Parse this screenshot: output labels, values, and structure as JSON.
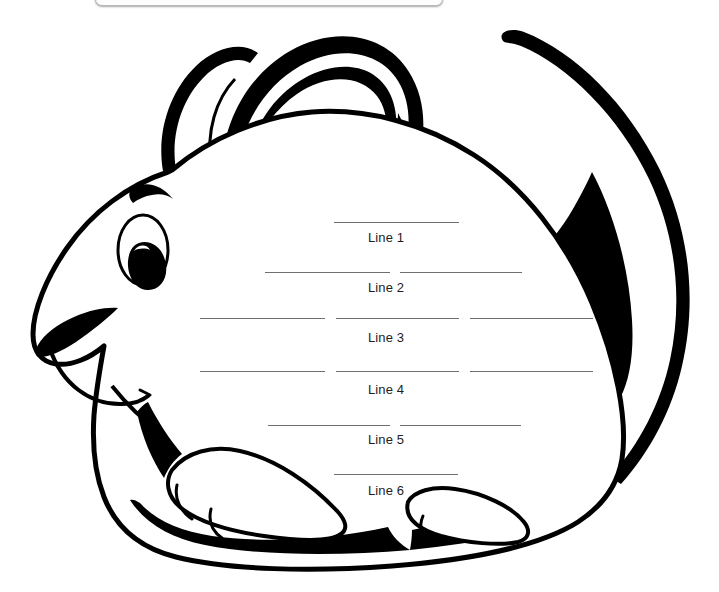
{
  "page": {
    "background_color": "#ffffff",
    "width": 719,
    "height": 592
  },
  "window_frame": {
    "visible": true,
    "border_color": "#b9b9b9"
  },
  "artwork": {
    "subject": "mouse",
    "style": "black-and-white line art coloring page",
    "stroke_color": "#000000",
    "fill_color": "#ffffff",
    "parts": [
      "tail",
      "large-ear",
      "small-ear",
      "head",
      "eyebrow",
      "eye",
      "pupil",
      "nose",
      "mouth",
      "body",
      "front-paw",
      "rear-paw",
      "ground-shadow"
    ]
  },
  "worksheet": {
    "line_color": "#6f6f6f",
    "label_color": "#1d1d1d",
    "rows": [
      {
        "label": "Line 1",
        "label_x": 368,
        "label_y": 230,
        "rules": [
          {
            "x": 334,
            "y": 222,
            "w": 125
          }
        ]
      },
      {
        "label": "Line 2",
        "label_x": 368,
        "label_y": 280,
        "rules": [
          {
            "x": 265,
            "y": 272,
            "w": 125
          },
          {
            "x": 400,
            "y": 272,
            "w": 122
          }
        ]
      },
      {
        "label": "Line 3",
        "label_x": 368,
        "label_y": 330,
        "rules": [
          {
            "x": 200,
            "y": 318,
            "w": 125
          },
          {
            "x": 336,
            "y": 318,
            "w": 123
          },
          {
            "x": 470,
            "y": 318,
            "w": 123
          }
        ]
      },
      {
        "label": "Line 4",
        "label_x": 368,
        "label_y": 382,
        "rules": [
          {
            "x": 200,
            "y": 371,
            "w": 125
          },
          {
            "x": 336,
            "y": 371,
            "w": 123
          },
          {
            "x": 470,
            "y": 371,
            "w": 123
          }
        ]
      },
      {
        "label": "Line 5",
        "label_x": 368,
        "label_y": 432,
        "rules": [
          {
            "x": 268,
            "y": 425,
            "w": 122
          },
          {
            "x": 400,
            "y": 425,
            "w": 121
          }
        ]
      },
      {
        "label": "Line 6",
        "label_x": 368,
        "label_y": 483,
        "rules": [
          {
            "x": 334,
            "y": 474,
            "w": 124
          }
        ]
      }
    ]
  }
}
